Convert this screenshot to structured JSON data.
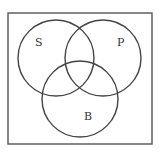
{
  "diagram": {
    "type": "venn",
    "universe": {
      "x": 8,
      "y": 13,
      "width": 144,
      "height": 131
    },
    "sets": [
      {
        "id": "S",
        "label": "S",
        "cx": 56,
        "cy": 58,
        "r": 38,
        "label_x": 38,
        "label_y": 45
      },
      {
        "id": "P",
        "label": "P",
        "cx": 103,
        "cy": 58,
        "r": 38,
        "label_x": 120,
        "label_y": 45
      },
      {
        "id": "B",
        "label": "B",
        "cx": 80,
        "cy": 99,
        "r": 38,
        "label_x": 87,
        "label_y": 119
      }
    ],
    "stroke_color": "#444444"
  }
}
